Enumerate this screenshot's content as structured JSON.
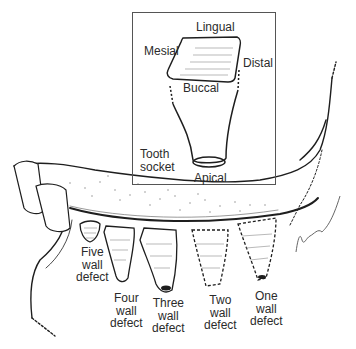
{
  "figure": {
    "inset": {
      "title_label": "Tooth socket",
      "title_lines": [
        "Tooth",
        "socket"
      ],
      "labels": {
        "lingual": "Lingual",
        "mesial": "Mesial",
        "distal": "Distal",
        "buccal": "Buccal",
        "apical": "Apical"
      }
    },
    "defects": [
      {
        "lines": [
          "Five",
          "wall",
          "defect"
        ]
      },
      {
        "lines": [
          "Four",
          "wall",
          "defect"
        ]
      },
      {
        "lines": [
          "Three",
          "wall",
          "defect"
        ]
      },
      {
        "lines": [
          "Two",
          "wall",
          "defect"
        ]
      },
      {
        "lines": [
          "One",
          "wall",
          "defect"
        ]
      }
    ],
    "colors": {
      "line": "#1e1e1e",
      "hatch": "#8a8a8a",
      "background": "#ffffff"
    }
  }
}
